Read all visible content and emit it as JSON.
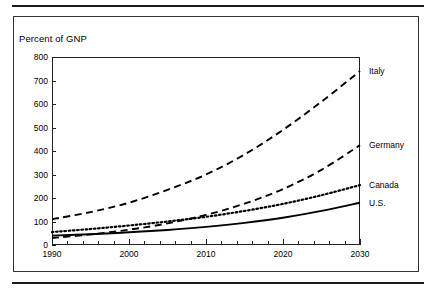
{
  "figure": {
    "axis_caption": "Percent of GNP"
  },
  "chart_data": {
    "type": "line",
    "title": "",
    "subtitle": "",
    "xlabel": "",
    "ylabel": "Percent of GNP",
    "xlim": [
      1990,
      2030
    ],
    "ylim": [
      0,
      800
    ],
    "grid": false,
    "legend_position": "right-inline",
    "x_ticks": [
      1990,
      2000,
      2010,
      2020,
      2030
    ],
    "x_minor_tick_step": 2,
    "y_ticks": [
      0,
      100,
      200,
      300,
      400,
      500,
      600,
      700,
      800
    ],
    "x": [
      1990,
      1995,
      2000,
      2005,
      2010,
      2015,
      2020,
      2025,
      2030
    ],
    "series": [
      {
        "name": "Italy",
        "line_style": "dashed",
        "color": "#000000",
        "values": [
          110,
          140,
          180,
          235,
          300,
          385,
          490,
          610,
          740
        ]
      },
      {
        "name": "Germany",
        "line_style": "dashed",
        "color": "#000000",
        "values": [
          30,
          45,
          65,
          92,
          128,
          176,
          238,
          320,
          425
        ]
      },
      {
        "name": "Canada",
        "line_style": "dotted",
        "color": "#000000",
        "values": [
          55,
          68,
          83,
          100,
          120,
          145,
          175,
          212,
          255
        ]
      },
      {
        "name": "U.S.",
        "line_style": "solid",
        "color": "#000000",
        "values": [
          40,
          46,
          54,
          64,
          77,
          94,
          116,
          145,
          180
        ]
      }
    ]
  }
}
